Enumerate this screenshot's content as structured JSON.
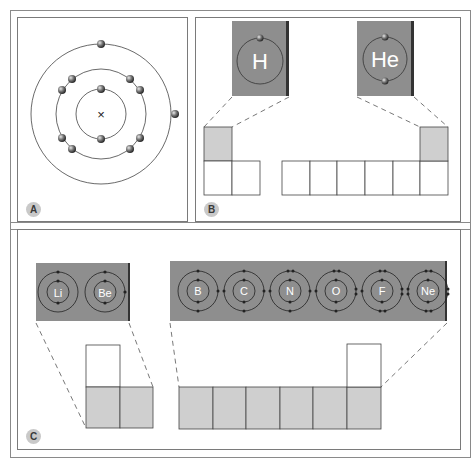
{
  "panels": {
    "a": {
      "label": "A",
      "atom": {
        "nucleus_symbol": "×",
        "shells": [
          {
            "radius": 25,
            "electrons": 2
          },
          {
            "radius": 45,
            "electrons": 8
          },
          {
            "radius": 70,
            "electrons": 2
          }
        ]
      }
    },
    "b": {
      "label": "B",
      "cards": [
        {
          "symbol": "H",
          "electrons": 1
        },
        {
          "symbol": "He",
          "electrons": 2
        }
      ],
      "grid": {
        "left_block_cells": 2,
        "right_block_cells": 6,
        "highlighted": [
          "H",
          "He"
        ]
      }
    },
    "c": {
      "label": "C",
      "cards": [
        {
          "group": "s-block",
          "elements": [
            {
              "symbol": "Li",
              "inner": 2,
              "outer": 1
            },
            {
              "symbol": "Be",
              "inner": 2,
              "outer": 2
            }
          ]
        },
        {
          "group": "p-block",
          "elements": [
            {
              "symbol": "B",
              "inner": 2,
              "outer": 3
            },
            {
              "symbol": "C",
              "inner": 2,
              "outer": 4
            },
            {
              "symbol": "N",
              "inner": 2,
              "outer": 5
            },
            {
              "symbol": "O",
              "inner": 2,
              "outer": 6
            },
            {
              "symbol": "F",
              "inner": 2,
              "outer": 7
            },
            {
              "symbol": "Ne",
              "inner": 2,
              "outer": 8
            }
          ]
        }
      ],
      "grid": {
        "left_block_cells": 2,
        "right_block_cells": 6
      }
    }
  },
  "colors": {
    "card_fill": "#8e8e8e",
    "card_edge": "#333333",
    "cell_highlight": "#cfcfcf",
    "line": "#444444",
    "badge": "#c9c9c9"
  }
}
